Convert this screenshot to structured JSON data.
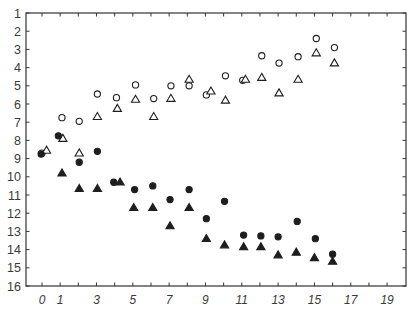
{
  "chart_data": {
    "type": "scatter",
    "title": "",
    "xlabel": "",
    "ylabel": "",
    "xlim": [
      -0.88,
      20.04
    ],
    "ylim": [
      1,
      16
    ],
    "y_inverted": true,
    "grid": false,
    "legend": null,
    "x_ticks": [
      0,
      1,
      2,
      3,
      4,
      5,
      6,
      7,
      8,
      9,
      10,
      11,
      12,
      13,
      14,
      15,
      16,
      17,
      18,
      19
    ],
    "x_tick_labels": [
      {
        "value": 0,
        "label": "0"
      },
      {
        "value": 1,
        "label": "1"
      },
      {
        "value": 3,
        "label": "3"
      },
      {
        "value": 5,
        "label": "5"
      },
      {
        "value": 7,
        "label": "7"
      },
      {
        "value": 9,
        "label": "9"
      },
      {
        "value": 11,
        "label": "11"
      },
      {
        "value": 13,
        "label": "13"
      },
      {
        "value": 15,
        "label": "15"
      },
      {
        "value": 17,
        "label": "17"
      },
      {
        "value": 19,
        "label": "19"
      }
    ],
    "y_ticks": [
      1,
      2,
      3,
      4,
      5,
      6,
      7,
      8,
      9,
      10,
      11,
      12,
      13,
      14,
      15,
      16
    ],
    "y_tick_labels": [
      "1",
      "2",
      "3",
      "4",
      "5",
      "6",
      "7",
      "8",
      "9",
      "10",
      "11",
      "12",
      "13",
      "14",
      "15",
      "16"
    ],
    "series": [
      {
        "name": "open-circles",
        "marker": "circle",
        "filled": false,
        "points": [
          [
            0,
            8.7
          ],
          [
            1.1,
            6.75
          ],
          [
            2.05,
            6.95
          ],
          [
            3.05,
            5.45
          ],
          [
            4.1,
            5.65
          ],
          [
            5.15,
            4.95
          ],
          [
            6.15,
            5.7
          ],
          [
            7.1,
            5.0
          ],
          [
            8.1,
            5.0
          ],
          [
            9.05,
            5.5
          ],
          [
            10.1,
            4.45
          ],
          [
            11.05,
            4.7
          ],
          [
            12.1,
            3.35
          ],
          [
            13.05,
            3.75
          ],
          [
            14.1,
            3.4
          ],
          [
            15.1,
            2.4
          ],
          [
            16.1,
            2.9
          ]
        ]
      },
      {
        "name": "open-triangles",
        "marker": "triangle",
        "filled": false,
        "points": [
          [
            0.25,
            8.55
          ],
          [
            1.15,
            7.9
          ],
          [
            2.05,
            8.7
          ],
          [
            3.05,
            6.7
          ],
          [
            4.15,
            6.25
          ],
          [
            5.15,
            5.75
          ],
          [
            6.15,
            6.7
          ],
          [
            7.1,
            5.7
          ],
          [
            8.1,
            4.65
          ],
          [
            9.3,
            5.3
          ],
          [
            10.1,
            5.8
          ],
          [
            11.2,
            4.65
          ],
          [
            12.1,
            4.55
          ],
          [
            13.05,
            5.4
          ],
          [
            14.1,
            4.65
          ],
          [
            15.1,
            3.2
          ],
          [
            16.1,
            3.75
          ]
        ]
      },
      {
        "name": "filled-circles",
        "marker": "circle",
        "filled": true,
        "points": [
          [
            -0.05,
            8.75
          ],
          [
            0.9,
            7.75
          ],
          [
            2.05,
            9.2
          ],
          [
            3.05,
            8.6
          ],
          [
            3.95,
            10.3
          ],
          [
            5.1,
            10.7
          ],
          [
            6.1,
            10.5
          ],
          [
            7.05,
            11.25
          ],
          [
            8.1,
            10.7
          ],
          [
            9.05,
            12.3
          ],
          [
            10.05,
            11.35
          ],
          [
            11.1,
            13.2
          ],
          [
            12.05,
            13.25
          ],
          [
            13.0,
            13.3
          ],
          [
            14.05,
            12.45
          ],
          [
            15.05,
            13.4
          ],
          [
            16.0,
            14.25
          ]
        ]
      },
      {
        "name": "filled-triangles",
        "marker": "triangle",
        "filled": true,
        "points": [
          [
            1.1,
            9.8
          ],
          [
            2.05,
            10.65
          ],
          [
            3.05,
            10.65
          ],
          [
            4.3,
            10.3
          ],
          [
            5.05,
            11.7
          ],
          [
            6.1,
            11.7
          ],
          [
            7.05,
            12.7
          ],
          [
            8.1,
            11.7
          ],
          [
            9.05,
            13.4
          ],
          [
            10.05,
            13.75
          ],
          [
            11.1,
            13.85
          ],
          [
            12.05,
            13.85
          ],
          [
            13.0,
            14.3
          ],
          [
            14.0,
            14.15
          ],
          [
            15.0,
            14.45
          ],
          [
            16.0,
            14.65
          ]
        ]
      }
    ],
    "colors": {
      "axis": "#333333",
      "marker": "#1e1e1e",
      "background": "#ffffff"
    }
  }
}
